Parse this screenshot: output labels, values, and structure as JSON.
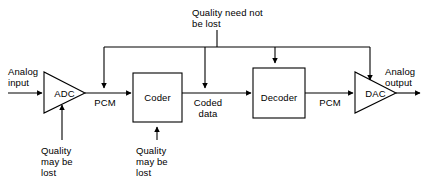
{
  "diagram": {
    "stroke_color": "#000000",
    "background_color": "#ffffff",
    "blocks": [
      {
        "id": "adc",
        "label": "ADC",
        "shape": "triangle"
      },
      {
        "id": "coder",
        "label": "Coder",
        "shape": "rectangle"
      },
      {
        "id": "decoder",
        "label": "Decoder",
        "shape": "rectangle"
      },
      {
        "id": "dac",
        "label": "DAC",
        "shape": "triangle"
      }
    ],
    "signal_labels": {
      "analog_input": "Analog\ninput",
      "pcm_left": "PCM",
      "coded_data": "Coded\ndata",
      "pcm_right": "PCM",
      "analog_output": "Analog\noutput"
    },
    "annotations": {
      "top_bus": "Quality need not\nbe lost",
      "adc_note": "Quality\nmay be\nlost",
      "coder_note": "Quality\nmay be\nlost"
    }
  }
}
